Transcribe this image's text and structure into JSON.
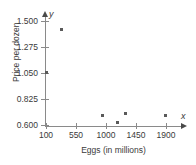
{
  "chart_data": {
    "type": "scatter",
    "title": "",
    "xlabel": "Eggs (in millions)",
    "ylabel": "Price per dozen",
    "x_var_symbol": "x",
    "y_var_symbol": "y",
    "xlim": [
      100,
      2050
    ],
    "ylim": [
      0.6,
      1.5
    ],
    "grid": false,
    "legend": null,
    "xticks": [
      100,
      550,
      1000,
      1450,
      1900
    ],
    "xtick_labels": [
      "100",
      "550",
      "1000",
      "1450",
      "1900"
    ],
    "yticks": [
      0.6,
      0.825,
      1.05,
      1.275,
      1.5
    ],
    "ytick_labels": [
      "0.600",
      "0.825",
      "1.050",
      "1.275",
      "1.500"
    ],
    "marker": "square-dot",
    "marker_color": "#5a5a5a",
    "axis_color": "#8a8a8a",
    "points": [
      {
        "x": 100,
        "y": 1.055
      },
      {
        "x": 330,
        "y": 1.43
      },
      {
        "x": 940,
        "y": 0.68
      },
      {
        "x": 1165,
        "y": 0.625
      },
      {
        "x": 1290,
        "y": 0.7
      },
      {
        "x": 1890,
        "y": 0.68
      }
    ]
  }
}
